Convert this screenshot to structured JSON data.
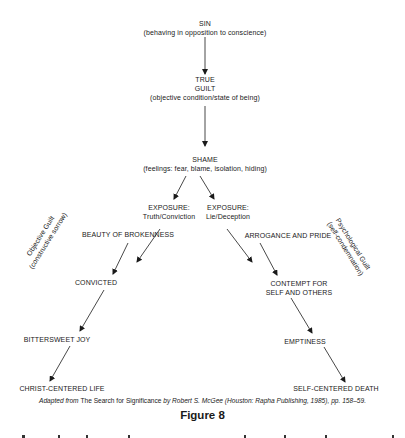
{
  "nodes": {
    "sin": {
      "title": "SIN",
      "subtitle": "(behaving in opposition to conscience)"
    },
    "true_guilt": {
      "line1": "TRUE",
      "line2": "GUILT",
      "subtitle": "(objective condition/state of being)"
    },
    "shame": {
      "title": "SHAME",
      "subtitle": "(feelings: fear, blame, isolation, hiding)"
    },
    "exposure_truth": {
      "line1": "EXPOSURE:",
      "line2": "Truth/Conviction"
    },
    "exposure_lie": {
      "line1": "EXPOSURE:",
      "line2": "Lie/Deception"
    },
    "beauty": {
      "title": "BEAUTY OF BROKENNESS"
    },
    "arrogance": {
      "title": "ARROGANCE AND PRIDE"
    },
    "convicted": {
      "title": "CONVICTED"
    },
    "contempt": {
      "line1": "CONTEMPT FOR",
      "line2": "SELF AND OTHERS"
    },
    "bittersweet": {
      "title": "BITTERSWEET JOY"
    },
    "emptiness": {
      "title": "EMPTINESS"
    },
    "christ_life": {
      "title": "CHRIST-CENTERED LIFE"
    },
    "self_death": {
      "title": "SELF-CENTERED DEATH"
    }
  },
  "side_labels": {
    "left": {
      "line1": "Objective Guilt",
      "line2": "(constructive sorrow)"
    },
    "right": {
      "line1": "Psychological Guilt",
      "line2": "(self-condemnation)"
    }
  },
  "caption": {
    "prefix": "Adapted from ",
    "book": "The Search for Significance",
    "suffix": " by Robert S. McGee (Houston: Rapha Publishing, 1985), pp. 158–59."
  },
  "figure_label": "Figure 8",
  "colors": {
    "ink": "#1a1a1a",
    "background": "#ffffff"
  }
}
